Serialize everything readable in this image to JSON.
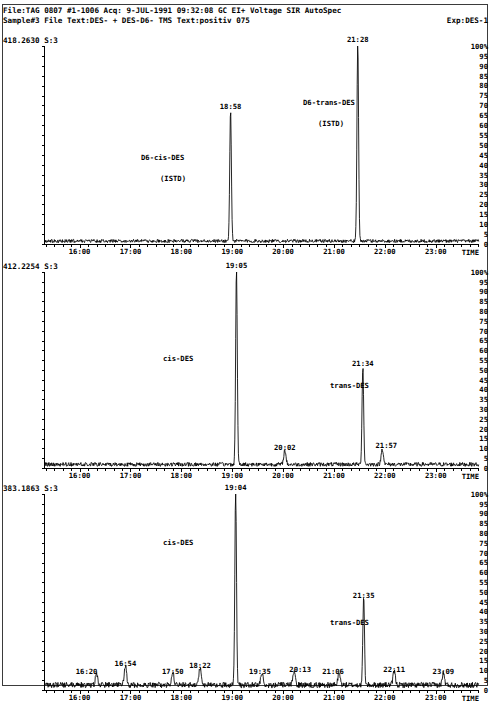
{
  "header": {
    "line1": "File:TAG 0807 #1-1006 Acq: 9-JUL-1991 09:32:08 GC EI+ Voltage SIR AutoSpec",
    "line2_left": "Sample#3 File Text:DES- + DES-D6- TMS Text:positiv 075",
    "line2_right": "Exp:DES-1"
  },
  "yaxis": {
    "ticks": [
      "100",
      "95",
      "90",
      "85",
      "80",
      "75",
      "70",
      "65",
      "60",
      "55",
      "50",
      "45",
      "40",
      "35",
      "30",
      "25",
      "20",
      "15",
      "10",
      "5",
      "0"
    ],
    "max": 100,
    "min": 0,
    "unit": "%"
  },
  "xaxis": {
    "ticks": [
      "16:00",
      "17:00",
      "18:00",
      "19:00",
      "20:00",
      "21:00",
      "22:00",
      "23:00"
    ],
    "label": "TIME",
    "min_minutes": 15.3,
    "max_minutes": 23.85
  },
  "chart_data": [
    {
      "type": "line",
      "title": "418.2630 S:3",
      "trace_id": "418.2630 S:3",
      "xlabel": "TIME",
      "ylabel": "%",
      "ylim": [
        0,
        100
      ],
      "xlim": [
        "15:18",
        "23:51"
      ],
      "grid": false,
      "peaks": [
        {
          "time": "18:58",
          "minutes": 18.967,
          "height": 66,
          "label": "18:58"
        },
        {
          "time": "21:28",
          "minutes": 21.467,
          "height": 100,
          "label": "21:28"
        }
      ],
      "annotations": [
        {
          "text": "D6-cis-DES",
          "time": "18:58"
        },
        {
          "text": "(ISTD)",
          "time": "18:58"
        },
        {
          "text": "D6-trans-DES",
          "time": "21:28"
        },
        {
          "text": "(ISTD)",
          "time": "21:28"
        }
      ]
    },
    {
      "type": "line",
      "title": "412.2254 S:3",
      "trace_id": "412.2254 S:3",
      "xlabel": "TIME",
      "ylabel": "%",
      "ylim": [
        0,
        100
      ],
      "xlim": [
        "15:18",
        "23:51"
      ],
      "grid": false,
      "peaks": [
        {
          "time": "19:05",
          "minutes": 19.083,
          "height": 100,
          "label": "19:05"
        },
        {
          "time": "20:02",
          "minutes": 20.033,
          "height": 7,
          "label": "20:02"
        },
        {
          "time": "21:34",
          "minutes": 21.567,
          "height": 50,
          "label": "21:34"
        },
        {
          "time": "21:57",
          "minutes": 21.95,
          "height": 8,
          "label": "21:57"
        }
      ],
      "annotations": [
        {
          "text": "cis-DES",
          "time": "19:05"
        },
        {
          "text": "trans-DES",
          "time": "21:34"
        }
      ]
    },
    {
      "type": "line",
      "title": "383.1863 S:3",
      "trace_id": "383.1863 S:3",
      "xlabel": "TIME",
      "ylabel": "%",
      "ylim": [
        0,
        100
      ],
      "xlim": [
        "15:18",
        "23:51"
      ],
      "grid": false,
      "peaks": [
        {
          "time": "16:20",
          "minutes": 16.333,
          "height": 6,
          "label": "16:20"
        },
        {
          "time": "16:54",
          "minutes": 16.9,
          "height": 10,
          "label": "16:54"
        },
        {
          "time": "17:50",
          "minutes": 17.833,
          "height": 6,
          "label": "17:50"
        },
        {
          "time": "18:22",
          "minutes": 18.367,
          "height": 9,
          "label": "18:22"
        },
        {
          "time": "19:04",
          "minutes": 19.067,
          "height": 100,
          "label": "19:04"
        },
        {
          "time": "19:35",
          "minutes": 19.583,
          "height": 6,
          "label": "19:35"
        },
        {
          "time": "20:13",
          "minutes": 20.217,
          "height": 7,
          "label": "20:13"
        },
        {
          "time": "21:06",
          "minutes": 21.1,
          "height": 6,
          "label": "21:06"
        },
        {
          "time": "21:35",
          "minutes": 21.583,
          "height": 45,
          "label": "21:35"
        },
        {
          "time": "22:11",
          "minutes": 22.183,
          "height": 7,
          "label": "22:11"
        },
        {
          "time": "23:09",
          "minutes": 23.15,
          "height": 6,
          "label": "23:09"
        }
      ],
      "annotations": [
        {
          "text": "cis-DES",
          "time": "19:04"
        },
        {
          "text": "trans-DES",
          "time": "21:35"
        }
      ]
    }
  ]
}
